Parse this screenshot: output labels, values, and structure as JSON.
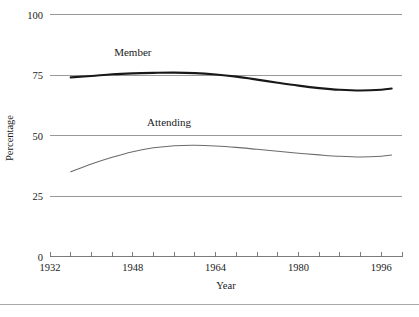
{
  "chart_data": {
    "type": "line",
    "title": "",
    "subtitle": "",
    "xlabel": "Year",
    "ylabel": "Percentage",
    "xlim": [
      1932,
      2000
    ],
    "ylim": [
      0,
      100
    ],
    "grid": true,
    "grid_axis": "y",
    "legend": "inline-labels",
    "legend_position": "inline above each curve",
    "y_ticks": [
      0,
      25,
      50,
      75,
      100
    ],
    "y_tick_labels": [
      "0",
      "25",
      "50",
      "75",
      "100"
    ],
    "x_ticks": [
      1932,
      1936,
      1940,
      1944,
      1948,
      1952,
      1956,
      1960,
      1964,
      1968,
      1972,
      1976,
      1980,
      1984,
      1988,
      1992,
      1996,
      2000
    ],
    "x_tick_labels_major": [
      "1932",
      "1948",
      "1964",
      "1980",
      "1996"
    ],
    "x_major_ticks": [
      1932,
      1948,
      1964,
      1980,
      1996
    ],
    "series": [
      {
        "name": "Member",
        "label": "Member",
        "color": "#181818",
        "line_width": 2.15,
        "x": [
          1936,
          1940,
          1944,
          1948,
          1952,
          1956,
          1960,
          1964,
          1968,
          1972,
          1976,
          1980,
          1984,
          1988,
          1992,
          1996,
          1998
        ],
        "values": [
          74.0,
          74.6,
          75.3,
          75.7,
          75.9,
          76.0,
          75.8,
          75.2,
          74.3,
          73.1,
          71.8,
          70.6,
          69.6,
          68.9,
          68.6,
          68.9,
          69.4
        ]
      },
      {
        "name": "Attending",
        "label": "Attending",
        "color": "#6b6b6b",
        "line_width": 1.05,
        "x": [
          1936,
          1940,
          1944,
          1948,
          1952,
          1956,
          1960,
          1964,
          1968,
          1972,
          1976,
          1980,
          1984,
          1988,
          1992,
          1996,
          1998
        ],
        "values": [
          35.0,
          38.2,
          41.0,
          43.3,
          44.9,
          45.8,
          46.0,
          45.7,
          45.1,
          44.3,
          43.5,
          42.7,
          42.0,
          41.4,
          41.1,
          41.4,
          41.9
        ]
      }
    ],
    "annotations": [
      {
        "text": "Member",
        "x": 1948,
        "y": 83
      },
      {
        "text": "Attending",
        "x": 1955,
        "y": 54
      }
    ]
  },
  "axes": {
    "y_axis_title": "Percentage",
    "x_axis_title": "Year"
  }
}
